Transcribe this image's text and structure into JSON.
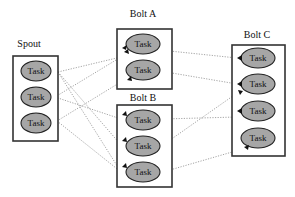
{
  "diagram": {
    "nodes": {
      "spout": {
        "title": "Spout",
        "tasks": [
          "Task",
          "Task",
          "Task"
        ]
      },
      "bolt_a": {
        "title": "Bolt A",
        "tasks": [
          "Task",
          "Task"
        ]
      },
      "bolt_b": {
        "title": "Bolt B",
        "tasks": [
          "Task",
          "Task",
          "Task"
        ]
      },
      "bolt_c": {
        "title": "Bolt C",
        "tasks": [
          "Task",
          "Task",
          "Task",
          "Task"
        ]
      }
    },
    "edges": [
      {
        "from": "spout.0",
        "to": "bolt_a.0"
      },
      {
        "from": "spout.0",
        "to": "bolt_b.1"
      },
      {
        "from": "spout.0",
        "to": "bolt_b.2"
      },
      {
        "from": "spout.1",
        "to": "bolt_a.0"
      },
      {
        "from": "spout.1",
        "to": "bolt_b.0"
      },
      {
        "from": "spout.2",
        "to": "bolt_a.1"
      },
      {
        "from": "spout.2",
        "to": "bolt_b.2"
      },
      {
        "from": "bolt_a.0",
        "to": "bolt_c.0"
      },
      {
        "from": "bolt_a.1",
        "to": "bolt_c.1"
      },
      {
        "from": "bolt_b.0",
        "to": "bolt_c.2"
      },
      {
        "from": "bolt_b.1",
        "to": "bolt_c.1"
      },
      {
        "from": "bolt_b.2",
        "to": "bolt_c.3"
      }
    ]
  }
}
